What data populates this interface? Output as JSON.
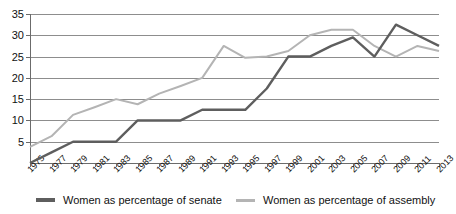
{
  "chart_data": {
    "type": "line",
    "title": "",
    "xlabel": "",
    "ylabel": "",
    "ylim": [
      0,
      35
    ],
    "yticks": [
      0,
      5,
      10,
      15,
      20,
      25,
      30,
      35
    ],
    "ytick_labels": [
      "",
      "5",
      "10",
      "15",
      "20",
      "25",
      "30",
      "35"
    ],
    "grid": true,
    "legend_position": "bottom",
    "categories": [
      "1975",
      "1977",
      "1979",
      "1981",
      "1983",
      "1985",
      "1987",
      "1989",
      "1991",
      "1993",
      "1995",
      "1997",
      "1999",
      "2001",
      "2003",
      "2005",
      "2007",
      "2009",
      "2011",
      "2013"
    ],
    "series": [
      {
        "name": "Women as percentage of senate",
        "color": "#5e5e5e",
        "values": [
          0,
          2.5,
          5,
          5,
          5,
          10,
          10,
          10,
          12.5,
          12.5,
          12.5,
          17.5,
          25,
          25,
          27.5,
          29.5,
          25,
          32.5,
          30,
          27.5
        ]
      },
      {
        "name": "Women as percentage of assembly",
        "color": "#b4b4b4",
        "values": [
          3.8,
          6.3,
          11.3,
          13.1,
          15,
          13.8,
          16.3,
          18.1,
          20,
          27.5,
          24.7,
          25,
          26.3,
          30,
          31.3,
          31.3,
          27.5,
          25,
          27.5,
          26.3
        ]
      }
    ]
  },
  "legend": {
    "entries": [
      {
        "label": "Women as percentage of senate",
        "color": "#5e5e5e"
      },
      {
        "label": "Women as percentage of assembly",
        "color": "#b4b4b4"
      }
    ]
  }
}
